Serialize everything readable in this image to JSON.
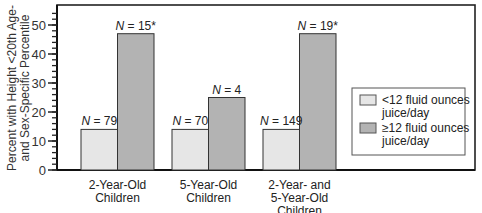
{
  "chart_data": {
    "type": "bar",
    "title": "",
    "xlabel": "",
    "ylabel": "Percent with Height <20th Age- and Sex-Specific Percentile",
    "ylabel_lines": [
      "Percent with Height <20th Age-",
      "and Sex-Specific Percentile"
    ],
    "ylim": [
      0,
      55
    ],
    "yticks": [
      0,
      10,
      20,
      30,
      40,
      50
    ],
    "minor_tick_step": 2,
    "grid": false,
    "legend_position": "right",
    "categories": [
      {
        "lines": [
          "2-Year-Old",
          "Children"
        ]
      },
      {
        "lines": [
          "5-Year-Old",
          "Children"
        ]
      },
      {
        "lines": [
          "2-Year- and",
          "5-Year-Old",
          "Children"
        ]
      }
    ],
    "series": [
      {
        "name": "<12 fluid ounces juice/day",
        "legend_lines": [
          "<12 fluid ounces",
          "juice/day"
        ],
        "color": "#e6e6e6",
        "values": [
          14,
          14,
          14
        ],
        "n_labels": [
          {
            "italic": "N",
            "rest": " = 79"
          },
          {
            "italic": "N",
            "rest": " = 70"
          },
          {
            "italic": "N",
            "rest": " = 149"
          }
        ]
      },
      {
        "name": "≥12 fluid ounces juice/day",
        "legend_lines": [
          "≥12 fluid ounces",
          "juice/day"
        ],
        "color": "#b3b3b3",
        "values": [
          47,
          25,
          47
        ],
        "n_labels": [
          {
            "italic": "N",
            "rest": " = 15*"
          },
          {
            "italic": "N",
            "rest": " = 4"
          },
          {
            "italic": "N",
            "rest": " = 19*"
          }
        ]
      }
    ]
  }
}
